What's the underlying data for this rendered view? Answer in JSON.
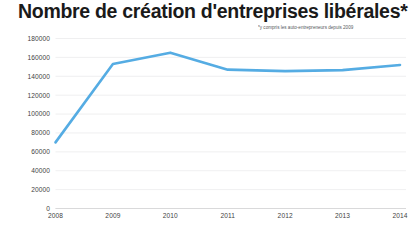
{
  "chart_data": {
    "type": "line",
    "title": "Nombre de création d'entreprises libérales*",
    "subtitle": "*y compris les auto-entrepreneurs depuis 2009",
    "xlabel": "",
    "ylabel": "",
    "categories": [
      "2008",
      "2009",
      "2010",
      "2011",
      "2012",
      "2013",
      "2014"
    ],
    "series": [
      {
        "name": "Créations d'entreprises libérales",
        "color": "#55ace3",
        "values": [
          70000,
          153000,
          165000,
          147000,
          145500,
          146500,
          152000
        ]
      }
    ],
    "ylim": [
      0,
      180000
    ],
    "ytick_values": [
      0,
      20000,
      40000,
      60000,
      80000,
      100000,
      120000,
      140000,
      160000,
      180000
    ],
    "ytick_labels": [
      "0",
      "20000",
      "40000",
      "60000",
      "80000",
      "100000",
      "120000",
      "140000",
      "160000",
      "180000"
    ],
    "xtick_labels": [
      "2008",
      "2009",
      "2010",
      "2011",
      "2012",
      "2013",
      "2014"
    ],
    "grid": true,
    "grid_color": "#ededee",
    "legend": false,
    "legend_position": "none",
    "background": "#ffffff",
    "line_width": 2.6
  }
}
